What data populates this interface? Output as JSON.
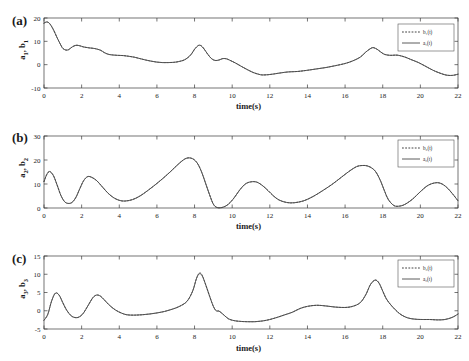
{
  "figure": {
    "xlabel": "time(s)",
    "xticks": [
      0,
      2,
      4,
      6,
      8,
      10,
      12,
      14,
      16,
      18,
      20,
      22
    ],
    "xlim": [
      0,
      22
    ],
    "colors": {
      "solid": "#4a4a4a",
      "dashed": "#2e2e2e",
      "axis": "#3a3a3a"
    }
  },
  "panels": [
    {
      "tag": "(a)",
      "ylabel": "a 1 , b 1",
      "ylabel_plain": "a1, b1",
      "yticks": [
        -10,
        0,
        10,
        20
      ],
      "ylim": [
        -10,
        20
      ],
      "legend": [
        {
          "label": "b₁(t)",
          "style": "dashed"
        },
        {
          "label": "a₁(t)",
          "style": "solid"
        }
      ]
    },
    {
      "tag": "(b)",
      "ylabel": "a 2 , b 2",
      "ylabel_plain": "a2, b2",
      "yticks": [
        0,
        10,
        20,
        30
      ],
      "ylim": [
        0,
        30
      ],
      "legend": [
        {
          "label": "b₂(t)",
          "style": "dashed"
        },
        {
          "label": "a₂(t)",
          "style": "solid"
        }
      ]
    },
    {
      "tag": "(c)",
      "ylabel": "a 3 , b 3",
      "ylabel_plain": "a3, b3",
      "yticks": [
        -5,
        0,
        5,
        10,
        15
      ],
      "ylim": [
        -5,
        15
      ],
      "legend": [
        {
          "label": "b₃(t)",
          "style": "dashed"
        },
        {
          "label": "a₃(t)",
          "style": "solid"
        }
      ]
    }
  ],
  "chart_data": [
    {
      "type": "line",
      "title": "(a)",
      "xlabel": "time(s)",
      "ylabel": "a1, b1",
      "xlim": [
        0,
        22
      ],
      "ylim": [
        -10,
        20
      ],
      "xticks": [
        0,
        2,
        4,
        6,
        8,
        10,
        12,
        14,
        16,
        18,
        20,
        22
      ],
      "yticks": [
        -10,
        0,
        10,
        20
      ],
      "grid": false,
      "legend": [
        "b1(t)",
        "a1(t)"
      ],
      "legend_position": "upper right",
      "x": [
        0,
        0.15,
        0.3,
        0.5,
        0.7,
        0.9,
        1.0,
        1.15,
        1.3,
        1.5,
        1.7,
        1.9,
        2.1,
        2.4,
        2.7,
        3.0,
        3.2,
        3.4,
        3.6,
        3.9,
        4.2,
        4.5,
        4.8,
        5.1,
        5.4,
        5.7,
        6.0,
        6.3,
        6.6,
        6.9,
        7.2,
        7.5,
        7.8,
        8.0,
        8.2,
        8.35,
        8.5,
        8.7,
        8.9,
        9.1,
        9.3,
        9.5,
        9.7,
        9.9,
        10.2,
        10.5,
        10.8,
        11.1,
        11.4,
        11.6,
        11.9,
        12.2,
        12.6,
        13.0,
        13.5,
        14.0,
        14.5,
        15.0,
        15.5,
        16.0,
        16.4,
        16.8,
        17.1,
        17.35,
        17.5,
        17.7,
        17.9,
        18.1,
        18.4,
        18.7,
        18.9,
        19.2,
        19.5,
        19.9,
        20.3,
        20.7,
        21.1,
        21.4,
        21.7,
        22.0
      ],
      "series": [
        {
          "name": "a1(t)",
          "values": [
            17.8,
            18.3,
            17.6,
            15.0,
            11.5,
            8.3,
            7.0,
            6.3,
            6.4,
            7.6,
            8.3,
            8.1,
            7.6,
            7.2,
            6.9,
            6.2,
            5.2,
            4.5,
            4.2,
            4.0,
            3.9,
            3.6,
            3.2,
            2.6,
            2.0,
            1.5,
            1.1,
            0.9,
            0.9,
            1.0,
            1.4,
            2.2,
            4.2,
            6.6,
            8.2,
            8.1,
            6.8,
            4.5,
            2.6,
            1.8,
            2.0,
            2.6,
            2.5,
            1.8,
            0.6,
            -0.8,
            -2.1,
            -3.3,
            -4.1,
            -4.4,
            -4.3,
            -4.0,
            -3.5,
            -3.1,
            -2.9,
            -2.4,
            -1.8,
            -1.2,
            -0.4,
            0.5,
            1.6,
            3.2,
            5.4,
            6.9,
            7.3,
            6.6,
            5.4,
            4.4,
            4.0,
            4.1,
            3.9,
            3.2,
            2.2,
            0.9,
            -0.8,
            -2.5,
            -3.8,
            -4.5,
            -4.6,
            -4.1
          ]
        },
        {
          "name": "b1(t)",
          "note": "near-identical to a1(t) after synchronization; overlaps solid curve",
          "values": [
            17.8,
            18.3,
            17.6,
            15.0,
            11.5,
            8.3,
            7.0,
            6.3,
            6.4,
            7.6,
            8.3,
            8.1,
            7.6,
            7.2,
            6.9,
            6.2,
            5.2,
            4.5,
            4.2,
            4.0,
            3.9,
            3.6,
            3.2,
            2.6,
            2.0,
            1.5,
            1.1,
            0.9,
            0.9,
            1.0,
            1.4,
            2.2,
            4.2,
            6.6,
            8.2,
            8.1,
            6.8,
            4.5,
            2.6,
            1.8,
            2.0,
            2.6,
            2.5,
            1.8,
            0.6,
            -0.8,
            -2.1,
            -3.3,
            -4.1,
            -4.4,
            -4.3,
            -4.0,
            -3.5,
            -3.1,
            -2.9,
            -2.4,
            -1.8,
            -1.2,
            -0.4,
            0.5,
            1.6,
            3.2,
            5.4,
            6.9,
            7.3,
            6.6,
            5.4,
            4.4,
            4.0,
            4.1,
            3.9,
            3.2,
            2.2,
            0.9,
            -0.8,
            -2.5,
            -3.8,
            -4.5,
            -4.6,
            -4.1
          ]
        }
      ]
    },
    {
      "type": "line",
      "title": "(b)",
      "xlabel": "time(s)",
      "ylabel": "a2, b2",
      "xlim": [
        0,
        22
      ],
      "ylim": [
        0,
        30
      ],
      "xticks": [
        0,
        2,
        4,
        6,
        8,
        10,
        12,
        14,
        16,
        18,
        20,
        22
      ],
      "yticks": [
        0,
        10,
        20,
        30
      ],
      "grid": false,
      "legend": [
        "b2(t)",
        "a2(t)"
      ],
      "legend_position": "upper right",
      "x": [
        0,
        0.15,
        0.3,
        0.5,
        0.7,
        0.9,
        1.1,
        1.3,
        1.5,
        1.7,
        1.9,
        2.1,
        2.3,
        2.5,
        2.8,
        3.1,
        3.4,
        3.7,
        4.0,
        4.3,
        4.7,
        5.1,
        5.5,
        5.9,
        6.3,
        6.7,
        7.1,
        7.4,
        7.6,
        7.8,
        8.0,
        8.2,
        8.4,
        8.6,
        8.8,
        9.0,
        9.2,
        9.5,
        9.8,
        10.1,
        10.4,
        10.7,
        11.0,
        11.3,
        11.6,
        11.9,
        12.2,
        12.5,
        12.9,
        13.3,
        13.8,
        14.3,
        14.8,
        15.3,
        15.8,
        16.2,
        16.6,
        16.9,
        17.2,
        17.5,
        17.7,
        17.9,
        18.1,
        18.3,
        18.6,
        18.9,
        19.2,
        19.6,
        20.0,
        20.4,
        20.8,
        21.1,
        21.4,
        21.7,
        22.0
      ],
      "series": [
        {
          "name": "a2(t)",
          "values": [
            11.0,
            14.0,
            15.2,
            13.5,
            9.5,
            5.2,
            2.6,
            1.9,
            2.4,
            4.5,
            8.0,
            11.3,
            13.0,
            12.9,
            11.4,
            8.8,
            6.2,
            4.3,
            3.2,
            2.9,
            3.5,
            5.0,
            7.2,
            9.6,
            12.2,
            15.0,
            18.0,
            20.0,
            20.8,
            20.8,
            20.0,
            18.0,
            14.5,
            10.0,
            5.5,
            1.6,
            0.2,
            0.3,
            1.6,
            4.2,
            7.5,
            10.0,
            10.9,
            10.8,
            9.4,
            7.3,
            5.0,
            3.3,
            2.3,
            2.2,
            3.0,
            4.8,
            7.2,
            9.8,
            12.8,
            15.2,
            17.2,
            17.7,
            17.5,
            16.2,
            14.2,
            11.0,
            7.0,
            3.5,
            1.0,
            0.8,
            1.6,
            3.8,
            6.8,
            9.4,
            10.5,
            10.2,
            8.6,
            6.0,
            3.0
          ]
        },
        {
          "name": "b2(t)",
          "note": "near-identical to a2(t) after synchronization; overlaps solid curve",
          "values": [
            11.0,
            14.0,
            15.2,
            13.5,
            9.5,
            5.2,
            2.6,
            1.9,
            2.4,
            4.5,
            8.0,
            11.3,
            13.0,
            12.9,
            11.4,
            8.8,
            6.2,
            4.3,
            3.2,
            2.9,
            3.5,
            5.0,
            7.2,
            9.6,
            12.2,
            15.0,
            18.0,
            20.0,
            20.8,
            20.8,
            20.0,
            18.0,
            14.5,
            10.0,
            5.5,
            1.6,
            0.2,
            0.3,
            1.6,
            4.2,
            7.5,
            10.0,
            10.9,
            10.8,
            9.4,
            7.3,
            5.0,
            3.3,
            2.3,
            2.2,
            3.0,
            4.8,
            7.2,
            9.8,
            12.8,
            15.2,
            17.2,
            17.7,
            17.5,
            16.2,
            14.2,
            11.0,
            7.0,
            3.5,
            1.0,
            0.8,
            1.6,
            3.8,
            6.8,
            9.4,
            10.5,
            10.2,
            8.6,
            6.0,
            3.0
          ]
        }
      ]
    },
    {
      "type": "line",
      "title": "(c)",
      "xlabel": "time(s)",
      "ylabel": "a3, b3",
      "xlim": [
        0,
        22
      ],
      "ylim": [
        -5,
        15
      ],
      "xticks": [
        0,
        2,
        4,
        6,
        8,
        10,
        12,
        14,
        16,
        18,
        20,
        22
      ],
      "yticks": [
        -5,
        0,
        5,
        10,
        15
      ],
      "grid": false,
      "legend": [
        "b3(t)",
        "a3(t)"
      ],
      "legend_position": "upper right",
      "x": [
        0,
        0.2,
        0.4,
        0.6,
        0.8,
        1.0,
        1.2,
        1.45,
        1.7,
        1.9,
        2.1,
        2.35,
        2.6,
        2.8,
        3.0,
        3.2,
        3.5,
        3.8,
        4.1,
        4.4,
        4.8,
        5.2,
        5.6,
        6.0,
        6.4,
        6.8,
        7.2,
        7.6,
        7.9,
        8.1,
        8.25,
        8.4,
        8.6,
        8.8,
        9.0,
        9.15,
        9.3,
        9.5,
        9.8,
        10.1,
        10.4,
        10.8,
        11.2,
        11.6,
        12.0,
        12.4,
        12.8,
        13.2,
        13.6,
        14.0,
        14.5,
        15.0,
        15.5,
        16.0,
        16.4,
        16.8,
        17.1,
        17.35,
        17.6,
        17.8,
        18.0,
        18.2,
        18.5,
        18.9,
        19.3,
        19.7,
        20.1,
        20.5,
        20.9,
        21.3,
        21.7,
        22.0
      ],
      "series": [
        {
          "name": "a3(t)",
          "values": [
            -2.6,
            -1.0,
            2.6,
            4.8,
            4.3,
            2.2,
            0.2,
            -1.4,
            -1.9,
            -1.6,
            -0.6,
            1.5,
            3.6,
            4.3,
            4.0,
            3.0,
            1.4,
            0.2,
            -0.6,
            -1.1,
            -1.2,
            -1.1,
            -0.9,
            -0.6,
            -0.2,
            0.4,
            1.2,
            2.6,
            5.4,
            8.8,
            10.1,
            9.6,
            7.0,
            4.0,
            1.2,
            0.0,
            -0.1,
            -0.9,
            -2.2,
            -2.7,
            -2.9,
            -3.0,
            -3.0,
            -2.8,
            -2.4,
            -1.8,
            -1.1,
            -0.4,
            0.6,
            1.2,
            1.5,
            1.3,
            1.0,
            0.9,
            1.2,
            2.2,
            4.4,
            7.2,
            8.4,
            7.6,
            5.4,
            3.2,
            1.2,
            -0.8,
            -1.9,
            -2.3,
            -2.4,
            -2.4,
            -2.5,
            -2.4,
            -1.8,
            -0.9
          ]
        },
        {
          "name": "b3(t)",
          "note": "near-identical to a3(t) after synchronization; overlaps solid curve",
          "values": [
            -2.6,
            -1.0,
            2.6,
            4.8,
            4.3,
            2.2,
            0.2,
            -1.4,
            -1.9,
            -1.6,
            -0.6,
            1.5,
            3.6,
            4.3,
            4.0,
            3.0,
            1.4,
            0.2,
            -0.6,
            -1.1,
            -1.2,
            -1.1,
            -0.9,
            -0.6,
            -0.2,
            0.4,
            1.2,
            2.6,
            5.4,
            8.8,
            10.3,
            9.8,
            7.0,
            4.0,
            1.2,
            0.0,
            -0.1,
            -0.9,
            -2.2,
            -2.7,
            -2.9,
            -3.0,
            -3.0,
            -2.8,
            -2.4,
            -1.8,
            -1.1,
            -0.4,
            0.6,
            1.2,
            1.5,
            1.3,
            1.0,
            0.9,
            1.2,
            2.2,
            4.4,
            7.2,
            8.4,
            7.6,
            5.4,
            3.2,
            1.2,
            -0.8,
            -1.9,
            -2.3,
            -2.4,
            -2.4,
            -2.5,
            -2.4,
            -1.8,
            -0.9
          ]
        }
      ]
    }
  ]
}
